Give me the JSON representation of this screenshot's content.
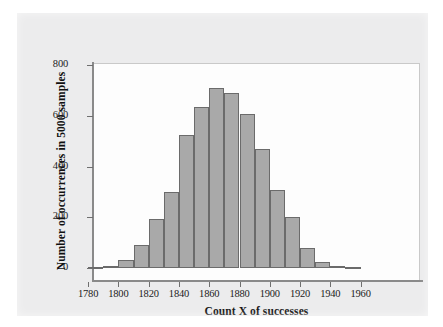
{
  "figure": {
    "background_color": "#ececed",
    "plot_background_color": "#fdfdfd",
    "bar_fill_color": "#a9a9a9",
    "bar_edge_color": "#6b6b6b",
    "axis_color": "#8a8a8a"
  },
  "chart_data": {
    "type": "bar",
    "title": "",
    "subtitle": "",
    "xlabel": "Count X of successes",
    "ylabel": "Number of occurrences in 5000 samples",
    "xlim": [
      1772,
      1988
    ],
    "ylim": [
      0,
      860
    ],
    "grid": false,
    "legend": null,
    "bin_width": 10,
    "x_ticks": [
      1780,
      1800,
      1820,
      1840,
      1860,
      1880,
      1900,
      1920,
      1940,
      1960
    ],
    "x_tick_labels": [
      "1780",
      "1800",
      "1820",
      "1840",
      "1860",
      "1880",
      "1900",
      "1920",
      "1940",
      "1960"
    ],
    "y_ticks": [
      0,
      200,
      400,
      600,
      800
    ],
    "y_tick_labels": [
      "0",
      "200",
      "400",
      "600",
      "800"
    ],
    "categories": [
      "1780-1790",
      "1790-1800",
      "1800-1810",
      "1810-1820",
      "1820-1830",
      "1830-1840",
      "1840-1850",
      "1850-1860",
      "1860-1870",
      "1870-1880",
      "1880-1890",
      "1890-1900",
      "1900-1910",
      "1910-1920",
      "1920-1930",
      "1930-1940",
      "1940-1950",
      "1950-1960"
    ],
    "bin_starts": [
      1780,
      1790,
      1800,
      1810,
      1820,
      1830,
      1840,
      1850,
      1860,
      1870,
      1880,
      1890,
      1900,
      1910,
      1920,
      1930,
      1940,
      1950
    ],
    "values": [
      3,
      8,
      30,
      92,
      192,
      298,
      525,
      637,
      710,
      690,
      607,
      471,
      307,
      202,
      80,
      25,
      8,
      2
    ],
    "annotations": []
  }
}
